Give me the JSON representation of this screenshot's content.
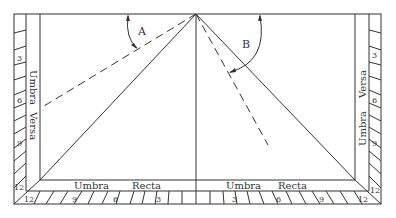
{
  "diagram": {
    "angles": {
      "left": "A",
      "right": "B"
    },
    "band_labels": {
      "left_top": "Umbra",
      "left_bottom": "Versa",
      "right_top": "Versa",
      "right_bottom": "Umbra",
      "bottom_left_1": "Umbra",
      "bottom_left_2": "Recta",
      "bottom_right_1": "Umbra",
      "bottom_right_2": "Recta"
    },
    "scale": {
      "left": [
        "3",
        "6",
        "9",
        "12"
      ],
      "right": [
        "3",
        "6",
        "9",
        "12"
      ],
      "bottom_left": [
        "12",
        "9",
        "6",
        "3"
      ],
      "bottom_right": [
        "3",
        "6",
        "9",
        "12"
      ]
    },
    "colors": {
      "line": "#333333",
      "background": "#ffffff"
    }
  }
}
